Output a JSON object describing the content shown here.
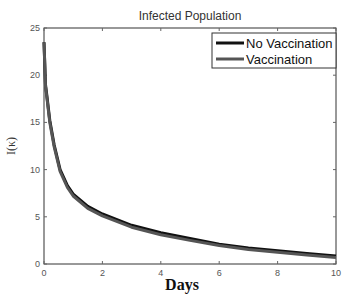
{
  "chart_data": {
    "type": "line",
    "title": "Infected Population",
    "xlabel": "Days",
    "ylabel": "I(κ)",
    "xlim": [
      0,
      10
    ],
    "ylim": [
      0,
      25
    ],
    "xticks": [
      "0",
      "2",
      "4",
      "6",
      "8",
      "10"
    ],
    "yticks": [
      "0",
      "5",
      "10",
      "15",
      "20",
      "25"
    ],
    "grid": false,
    "legend_position": "upper right",
    "x": [
      0,
      0.05,
      0.1,
      0.2,
      0.35,
      0.55,
      0.8,
      1.0,
      1.5,
      2,
      3,
      4,
      5,
      6,
      7,
      8,
      9,
      10
    ],
    "series": [
      {
        "name": "No Vaccination",
        "color": "#111111",
        "values": [
          23.5,
          19.0,
          17.8,
          15.2,
          12.6,
          10.0,
          8.3,
          7.4,
          6.1,
          5.3,
          4.1,
          3.3,
          2.7,
          2.1,
          1.7,
          1.4,
          1.1,
          0.85
        ]
      },
      {
        "name": "Vaccination",
        "color": "#555555",
        "values": [
          23.5,
          18.8,
          17.6,
          15.0,
          12.4,
          9.8,
          8.1,
          7.2,
          5.9,
          5.1,
          3.9,
          3.1,
          2.5,
          1.95,
          1.55,
          1.25,
          0.95,
          0.7
        ]
      }
    ]
  }
}
